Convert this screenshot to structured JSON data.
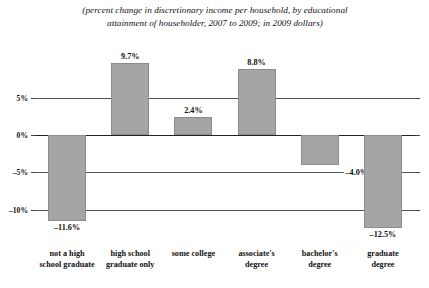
{
  "chart_data": {
    "type": "bar",
    "title": "(percent change in discretionary income per household, by educational attainment of householder, 2007 to 2009; in 2009 dollars)",
    "title_line1": "(percent change in discretionary income per household, by educational",
    "title_line2": "attainment of householder, 2007 to 2009; in 2009 dollars)",
    "xlabel": "",
    "ylabel": "",
    "ylim": [
      -15,
      12
    ],
    "grid": true,
    "legend": "none",
    "bar_color": "#a5a5a5",
    "categories": [
      "not a high school graduate",
      "high school graduate only",
      "some college",
      "associate's degree",
      "bachelor's degree",
      "graduate degree"
    ],
    "category_lines": [
      [
        "not a high",
        "school graduate"
      ],
      [
        "high school",
        "graduate only"
      ],
      [
        "some college",
        ""
      ],
      [
        "associate's",
        "degree"
      ],
      [
        "bachelor's",
        "degree"
      ],
      [
        "graduate",
        "degree"
      ]
    ],
    "values": [
      -11.6,
      9.7,
      2.4,
      8.8,
      -4.0,
      -12.5
    ],
    "value_labels": [
      "–11.6%",
      "9.7%",
      "2.4%",
      "8.8%",
      "–4.0%",
      "–12.5%"
    ],
    "yticks": [
      5,
      0,
      -5,
      -10
    ],
    "ytick_labels": [
      "5%",
      "0%",
      "–5%",
      "–10%"
    ]
  }
}
